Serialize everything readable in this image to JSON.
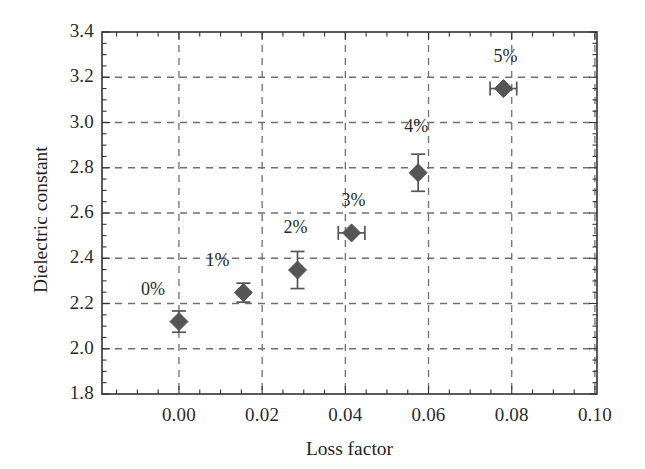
{
  "chart_data": {
    "type": "scatter",
    "title": "",
    "xlabel": "Loss factor",
    "ylabel": "Dielectric constant",
    "xlim": [
      -0.0185,
      0.1005
    ],
    "ylim": [
      1.8,
      3.4
    ],
    "grid": true,
    "grid_style": "dashed",
    "legend": null,
    "marker": "filled-diamond",
    "marker_color": "#555555",
    "error_bar_color": "#555555",
    "axis_color": "#333333",
    "grid_color": "#707070",
    "xticks": [
      0.0,
      0.02,
      0.04,
      0.06,
      0.08,
      0.1
    ],
    "xtick_labels": [
      "0.00",
      "0.02",
      "0.04",
      "0.06",
      "0.08",
      "0.10"
    ],
    "yticks": [
      1.8,
      2.0,
      2.2,
      2.4,
      2.6,
      2.8,
      3.0,
      3.2,
      3.4
    ],
    "ytick_labels": [
      "1.8",
      "2.0",
      "2.2",
      "2.4",
      "2.6",
      "2.8",
      "3.0",
      "3.2",
      "3.4"
    ],
    "x_minor_tick_interval": 0.005,
    "y_minor_tick_interval": 0.05,
    "points": [
      {
        "label": "0%",
        "x": 0.0,
        "y": 2.12,
        "yerr": 0.047,
        "xerr": 0.0,
        "label_dx": -26,
        "label_dy": -33
      },
      {
        "label": "1%",
        "x": 0.0155,
        "y": 2.248,
        "yerr": 0.042,
        "xerr": 0.0,
        "label_dx": -26,
        "label_dy": -33
      },
      {
        "label": "2%",
        "x": 0.0285,
        "y": 2.348,
        "yerr": 0.082,
        "xerr": 0.0,
        "label_dx": -2,
        "label_dy": -43
      },
      {
        "label": "3%",
        "x": 0.0415,
        "y": 2.512,
        "yerr": 0.0,
        "xerr": 0.0032,
        "label_dx": 2,
        "label_dy": -33
      },
      {
        "label": "4%",
        "x": 0.0575,
        "y": 2.778,
        "yerr": 0.082,
        "xerr": 0.0,
        "label_dx": -2,
        "label_dy": -47
      },
      {
        "label": "5%",
        "x": 0.078,
        "y": 3.15,
        "yerr": 0.0,
        "xerr": 0.0032,
        "label_dx": 2,
        "label_dy": -33
      }
    ]
  }
}
